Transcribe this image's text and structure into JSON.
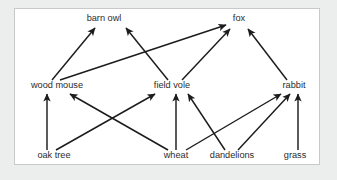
{
  "diagram": {
    "type": "food-web",
    "panel": {
      "background_color": "#ffffff",
      "border_color": "#c9c9c9",
      "outer_background_color": "#eceded"
    },
    "style": {
      "line_color": "#1c1c1c",
      "text_color": "#2b2b2b",
      "arrow_direction": "points from food source to consumer"
    },
    "levels": [
      {
        "name": "predators",
        "labels": [
          "barn owl",
          "fox"
        ]
      },
      {
        "name": "primary consumers",
        "labels": [
          "wood mouse",
          "field vole",
          "rabbit"
        ]
      },
      {
        "name": "producers",
        "labels": [
          "oak tree",
          "wheat",
          "dandelions",
          "grass"
        ]
      }
    ],
    "nodes": [
      {
        "id": "barn_owl",
        "label": "barn owl",
        "x": 104,
        "y": 21,
        "level": "predators"
      },
      {
        "id": "fox",
        "label": "fox",
        "x": 239,
        "y": 21,
        "level": "predators"
      },
      {
        "id": "wood_mouse",
        "label": "wood mouse",
        "x": 57,
        "y": 88,
        "level": "primary consumers"
      },
      {
        "id": "field_vole",
        "label": "field vole",
        "x": 172,
        "y": 88,
        "level": "primary consumers"
      },
      {
        "id": "rabbit",
        "label": "rabbit",
        "x": 294,
        "y": 88,
        "level": "primary consumers"
      },
      {
        "id": "oak_tree",
        "label": "oak tree",
        "x": 54,
        "y": 158,
        "level": "producers"
      },
      {
        "id": "wheat",
        "label": "wheat",
        "x": 176,
        "y": 158,
        "level": "producers"
      },
      {
        "id": "dandelions",
        "label": "dandelions",
        "x": 232,
        "y": 158,
        "level": "producers"
      },
      {
        "id": "grass",
        "label": "grass",
        "x": 295,
        "y": 158,
        "level": "producers"
      }
    ],
    "edges": [
      {
        "id": "oak-to-woodmouse",
        "from": "oak_tree",
        "to": "wood_mouse",
        "x1": 47,
        "y1": 150,
        "x2": 47,
        "y2": 94
      },
      {
        "id": "oak-to-fieldvole",
        "from": "oak_tree",
        "to": "field_vole",
        "x1": 56,
        "y1": 150,
        "x2": 155,
        "y2": 94
      },
      {
        "id": "wheat-to-woodmouse",
        "from": "wheat",
        "to": "wood_mouse",
        "x1": 168,
        "y1": 150,
        "x2": 70,
        "y2": 94
      },
      {
        "id": "wheat-to-fieldvole",
        "from": "wheat",
        "to": "field_vole",
        "x1": 176,
        "y1": 150,
        "x2": 176,
        "y2": 94
      },
      {
        "id": "wheat-to-rabbit",
        "from": "wheat",
        "to": "rabbit",
        "x1": 186,
        "y1": 150,
        "x2": 281,
        "y2": 94
      },
      {
        "id": "dandelions-to-fieldvole",
        "from": "dandelions",
        "to": "field_vole",
        "x1": 225,
        "y1": 150,
        "x2": 188,
        "y2": 94
      },
      {
        "id": "dandelions-to-rabbit",
        "from": "dandelions",
        "to": "rabbit",
        "x1": 238,
        "y1": 150,
        "x2": 290,
        "y2": 94
      },
      {
        "id": "grass-to-rabbit",
        "from": "grass",
        "to": "rabbit",
        "x1": 298,
        "y1": 150,
        "x2": 298,
        "y2": 94
      },
      {
        "id": "woodmouse-to-barnowl",
        "from": "wood_mouse",
        "to": "barn_owl",
        "x1": 52,
        "y1": 80,
        "x2": 95,
        "y2": 28
      },
      {
        "id": "woodmouse-to-fox",
        "from": "wood_mouse",
        "to": "fox",
        "x1": 60,
        "y1": 80,
        "x2": 226,
        "y2": 25
      },
      {
        "id": "fieldvole-to-barnowl",
        "from": "field_vole",
        "to": "barn_owl",
        "x1": 168,
        "y1": 80,
        "x2": 126,
        "y2": 28
      },
      {
        "id": "fieldvole-to-fox",
        "from": "field_vole",
        "to": "fox",
        "x1": 182,
        "y1": 80,
        "x2": 230,
        "y2": 29
      },
      {
        "id": "rabbit-to-fox",
        "from": "rabbit",
        "to": "fox",
        "x1": 287,
        "y1": 80,
        "x2": 248,
        "y2": 29
      }
    ]
  }
}
